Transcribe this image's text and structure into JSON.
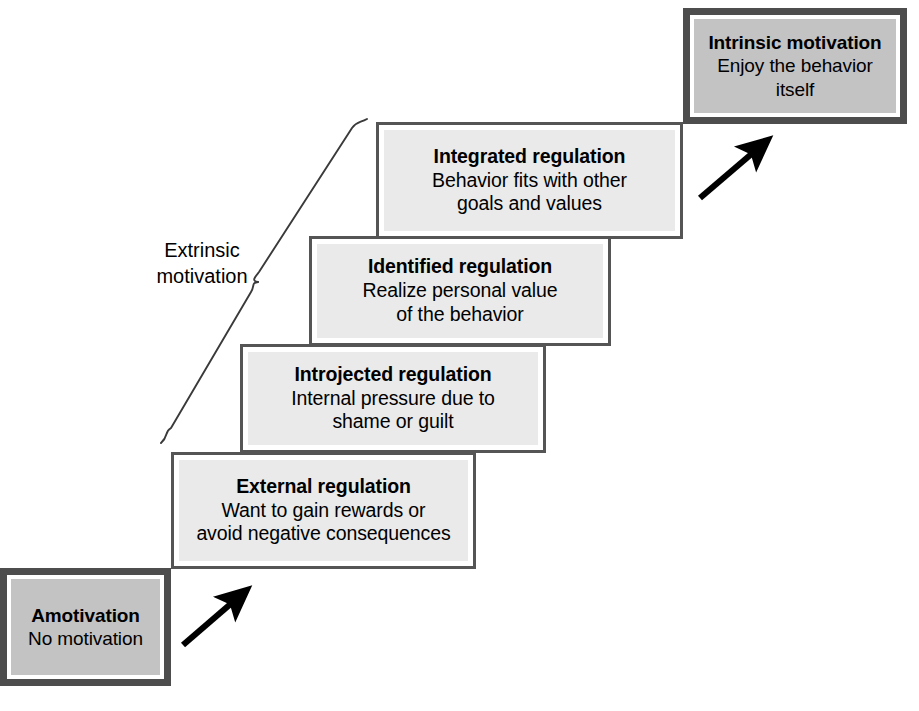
{
  "figure": {
    "type": "staircase-continuum-diagram",
    "background_color": "#ffffff",
    "text_color": "#000000"
  },
  "steps": [
    {
      "id": "amotivation",
      "title": "Amotivation",
      "desc_line_1": "No motivation",
      "desc_line_2": "",
      "desc_line_3": "",
      "emphasis": true,
      "fill_color": "#c3c3c3",
      "border_color": "#4d4d4d"
    },
    {
      "id": "external-regulation",
      "title": "External regulation",
      "desc_line_1": "Want to gain rewards or",
      "desc_line_2": "avoid negative consequences",
      "desc_line_3": "",
      "emphasis": false,
      "fill_color": "#eaeaea",
      "border_color": "#555555"
    },
    {
      "id": "introjected-regulation",
      "title": "Introjected regulation",
      "desc_line_1": "Internal pressure due to",
      "desc_line_2": "shame or guilt",
      "desc_line_3": "",
      "emphasis": false,
      "fill_color": "#eaeaea",
      "border_color": "#555555"
    },
    {
      "id": "identified-regulation",
      "title": "Identified regulation",
      "desc_line_1": "Realize personal value",
      "desc_line_2": "of the behavior",
      "desc_line_3": "",
      "emphasis": false,
      "fill_color": "#eaeaea",
      "border_color": "#555555"
    },
    {
      "id": "integrated-regulation",
      "title": "Integrated regulation",
      "desc_line_1": "Behavior fits with other",
      "desc_line_2": "goals and values",
      "desc_line_3": "",
      "emphasis": false,
      "fill_color": "#eaeaea",
      "border_color": "#555555"
    },
    {
      "id": "intrinsic-motivation",
      "title": "Intrinsic motivation",
      "desc_line_1": "Enjoy the behavior",
      "desc_line_2": "itself",
      "desc_line_3": "",
      "emphasis": true,
      "fill_color": "#c3c3c3",
      "border_color": "#4d4d4d"
    }
  ],
  "brace": {
    "label_line_1": "Extrinsic",
    "label_line_2": "motivation",
    "stroke_color": "#3a3a3a",
    "covers": [
      "External regulation",
      "Introjected regulation",
      "Identified regulation",
      "Integrated regulation"
    ]
  },
  "arrows": [
    {
      "id": "arrow-amotivation-to-external",
      "color": "#000000",
      "direction": "up-right"
    },
    {
      "id": "arrow-integrated-to-intrinsic",
      "color": "#000000",
      "direction": "up-right"
    }
  ]
}
